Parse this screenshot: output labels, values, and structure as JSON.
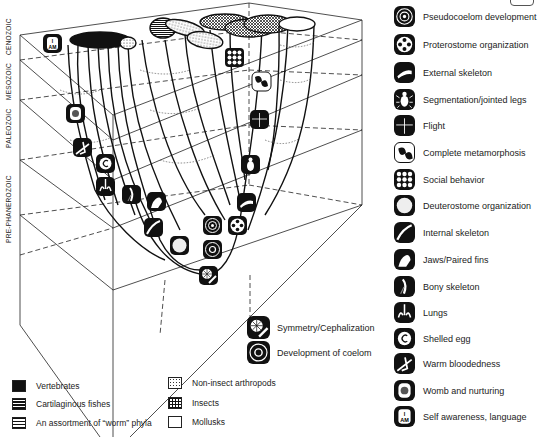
{
  "eras": [
    {
      "label": "CENOZOIC"
    },
    {
      "label": "MESOZOIC"
    },
    {
      "label": "PALEOZOIC"
    },
    {
      "label": "PRE-PHANEROZOIC"
    }
  ],
  "icon_key": [
    {
      "icon": "pseudocoelom-icon",
      "label": "Pseudocoelom development"
    },
    {
      "icon": "proterostome-icon",
      "label": "Proterostome organization"
    },
    {
      "icon": "external-skeleton-icon",
      "label": "External skeleton"
    },
    {
      "icon": "jointed-legs-icon",
      "label": "Segmentation/jointed legs"
    },
    {
      "icon": "flight-icon",
      "label": "Flight"
    },
    {
      "icon": "metamorphosis-icon",
      "label": "Complete metamorphosis"
    },
    {
      "icon": "social-behavior-icon",
      "label": "Social behavior"
    },
    {
      "icon": "deuterostome-icon",
      "label": "Deuterostome organization"
    },
    {
      "icon": "internal-skeleton-icon",
      "label": "Internal skeleton"
    },
    {
      "icon": "jaws-fins-icon",
      "label": "Jaws/Paired fins"
    },
    {
      "icon": "bony-skeleton-icon",
      "label": "Bony skeleton"
    },
    {
      "icon": "lungs-icon",
      "label": "Lungs"
    },
    {
      "icon": "shelled-egg-icon",
      "label": "Shelled egg"
    },
    {
      "icon": "warm-blood-icon",
      "label": "Warm bloodedness"
    },
    {
      "icon": "womb-icon",
      "label": "Womb and nurturing"
    },
    {
      "icon": "self-awareness-icon",
      "label": "Self awareness, language"
    }
  ],
  "base_key": [
    {
      "icon": "symmetry-icon",
      "label": "Symmetry/Cephalization"
    },
    {
      "icon": "coelom-icon",
      "label": "Development of coelom"
    }
  ],
  "self_awareness_glyph": "I AM",
  "legend": [
    {
      "swatch": "solid-black",
      "label": "Vertebrates"
    },
    {
      "swatch": "brick-pattern",
      "label": "Cartilaginous fishes"
    },
    {
      "swatch": "horizontal-lines",
      "label": "An assortment of “worm” phyla"
    },
    {
      "swatch": "stipple",
      "label": "Non-insect arthropods"
    },
    {
      "swatch": "crosshatch",
      "label": "Insects"
    },
    {
      "swatch": "white",
      "label": "Mollusks"
    }
  ]
}
